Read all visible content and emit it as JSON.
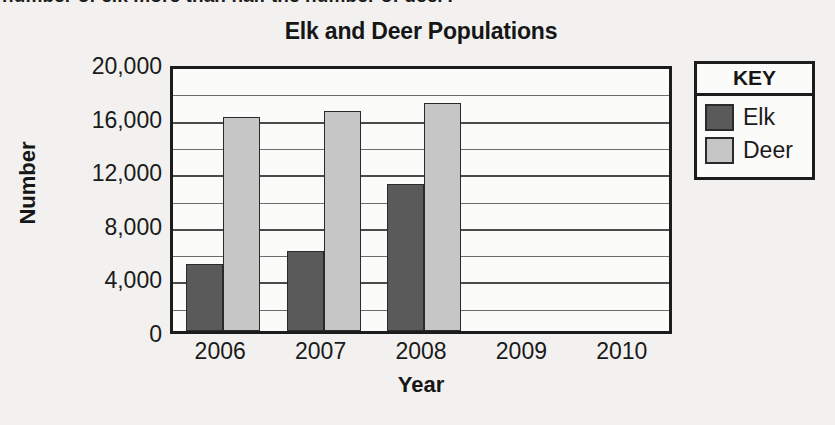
{
  "page": {
    "cutoff_question_text": "number of elk more than half the number of deer?"
  },
  "chart_data": {
    "type": "bar",
    "title": "Elk and Deer Populations",
    "xlabel": "Year",
    "ylabel": "Number",
    "categories": [
      "2006",
      "2007",
      "2008",
      "2009",
      "2010"
    ],
    "series": [
      {
        "name": "Elk",
        "color": "#5a5a5a",
        "values": [
          5000,
          6000,
          11000,
          null,
          null
        ]
      },
      {
        "name": "Deer",
        "color": "#c6c6c6",
        "values": [
          16000,
          16400,
          17000,
          null,
          null
        ]
      }
    ],
    "ylim": [
      0,
      20000
    ],
    "ytick_labels": [
      "0",
      "4,000",
      "8,000",
      "12,000",
      "16,000",
      "20,000"
    ],
    "ytick_values": [
      0,
      4000,
      8000,
      12000,
      16000,
      20000
    ],
    "minor_gridline_values": [
      2000,
      6000,
      10000,
      14000,
      18000
    ],
    "grid": true,
    "legend_position": "right-outside"
  },
  "legend": {
    "title": "KEY",
    "entries": [
      {
        "label": "Elk",
        "color": "#5a5a5a"
      },
      {
        "label": "Deer",
        "color": "#c6c6c6"
      }
    ]
  }
}
